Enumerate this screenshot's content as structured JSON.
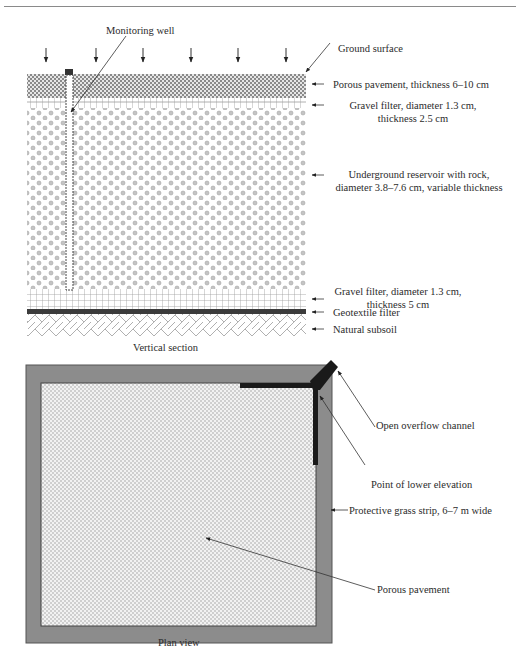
{
  "figure": {
    "vertical_section": {
      "caption": "Vertical section",
      "labels": {
        "monitoring_well": "Monitoring well",
        "ground_surface": "Ground surface",
        "porous_pavement": "Porous pavement, thickness 6–10 cm",
        "gravel_filter_top_line1": "Gravel filter, diameter 1.3 cm,",
        "gravel_filter_top_line2": "thickness 2.5 cm",
        "reservoir_line1": "Underground reservoir with rock,",
        "reservoir_line2": "diameter 3.8–7.6 cm, variable thickness",
        "gravel_filter_bottom_line1": "Gravel filter, diameter 1.3 cm,",
        "gravel_filter_bottom_line2": "thickness 5 cm",
        "geotextile": "Geotextile filter",
        "subsoil": "Natural subsoil"
      }
    },
    "plan_view": {
      "caption": "Plan view",
      "labels": {
        "overflow_channel": "Open overflow channel",
        "lower_elevation": "Point of lower elevation",
        "grass_strip": "Protective grass strip, 6–7 m wide",
        "porous_pavement": "Porous pavement"
      }
    },
    "colors": {
      "grass_strip": "#8c8c8c",
      "geotextile": "#3c3c3c",
      "channel": "#1a1a1a",
      "pavement_check": "#bdbdbd"
    }
  }
}
